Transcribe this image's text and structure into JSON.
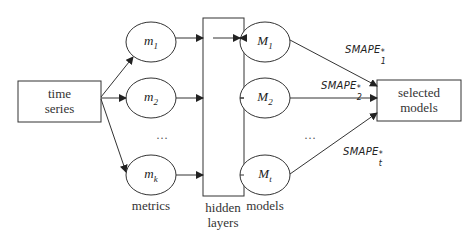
{
  "diagram": {
    "input": {
      "line1": "time",
      "line2": "series"
    },
    "metrics": [
      {
        "base": "m",
        "sub": "1"
      },
      {
        "base": "m",
        "sub": "2"
      },
      {
        "base": "m",
        "sub": "k"
      }
    ],
    "models": [
      {
        "base": "M",
        "sub": "1"
      },
      {
        "base": "M",
        "sub": "2"
      },
      {
        "base": "M",
        "sub": "t"
      }
    ],
    "ellipsis": "…",
    "labels": {
      "metrics": "metrics",
      "hidden_line1": "hidden",
      "hidden_line2": "layers",
      "models": "models"
    },
    "edges": [
      {
        "base": "SMAPE",
        "sub": "1",
        "sup": "*"
      },
      {
        "base": "SMAPE",
        "sub": "2",
        "sup": "*"
      },
      {
        "base": "SMAPE",
        "sub": "t",
        "sup": "*"
      }
    ],
    "output": {
      "line1": "selected",
      "line2": "models"
    },
    "colors": {
      "stroke": "#222222",
      "background": "#ffffff"
    }
  }
}
